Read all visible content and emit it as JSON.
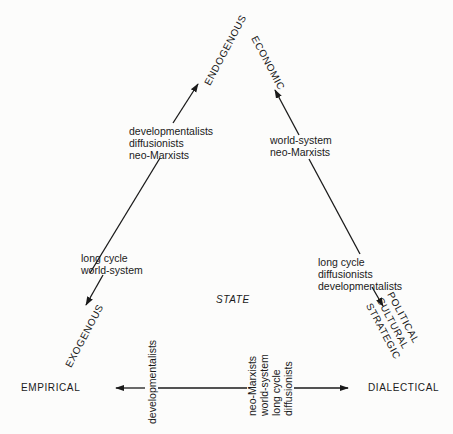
{
  "diagram": {
    "center_label": "STATE",
    "vertices": {
      "endogenous": "ENDOGENOUS",
      "economic": "ECONOMIC",
      "exogenous": "EXOGENOUS",
      "political_cultural_strategic": [
        "POLITICAL",
        "CULTURAL",
        "STRATEGIC"
      ],
      "empirical": "EMPIRICAL",
      "dialectical": "DIALECTICAL"
    },
    "axes": [
      {
        "name": "endogenous-exogenous",
        "toward_endogenous": [
          "developmentalists",
          "diffusionists",
          "neo-Marxists"
        ],
        "toward_exogenous": [
          "long cycle",
          "world-system"
        ]
      },
      {
        "name": "economic-political",
        "toward_economic": [
          "world-system",
          "neo-Marxists"
        ],
        "toward_political": [
          "long cycle",
          "diffusionists",
          "developmentalists"
        ]
      },
      {
        "name": "empirical-dialectical",
        "toward_empirical": [
          "developmentalists"
        ],
        "toward_dialectical": [
          "neo-Marxists",
          "world-system",
          "long cycle",
          "diffusionists"
        ]
      }
    ],
    "line_color": "#1a1a1a",
    "background": "#fcfcfb"
  }
}
